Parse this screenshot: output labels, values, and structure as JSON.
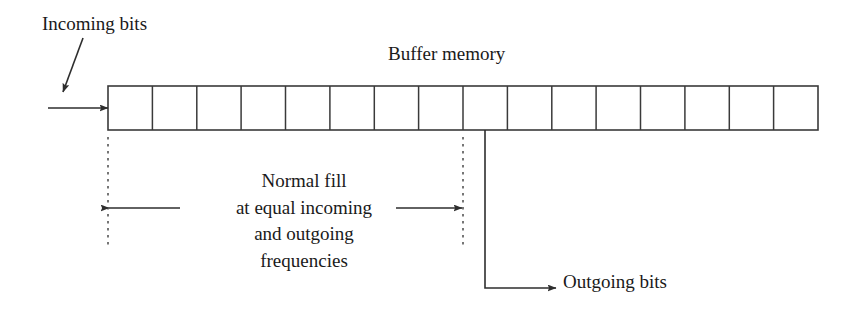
{
  "diagram": {
    "title_label": "Buffer memory",
    "incoming_label": "Incoming bits",
    "outgoing_label": "Outgoing bits",
    "fill_description_lines": [
      "Normal fill",
      "at equal incoming",
      "and outgoing",
      "frequencies"
    ],
    "buffer": {
      "cell_count": 16,
      "left_x": 108,
      "right_x": 818,
      "top_y": 86,
      "bottom_y": 130,
      "cell_width": 44.375
    },
    "markers": {
      "fill_region_left_x": 108,
      "fill_region_right_x": 463,
      "outgoing_tap_x": 485,
      "dotted_top_y": 137,
      "dotted_bottom_y": 248,
      "span_arrow_y": 208,
      "incoming_arrow_y": 108,
      "outgoing_elbow_y": 288
    },
    "colors": {
      "stroke": "#3a3a3a",
      "text": "#1a1a1a",
      "background": "#ffffff"
    }
  }
}
